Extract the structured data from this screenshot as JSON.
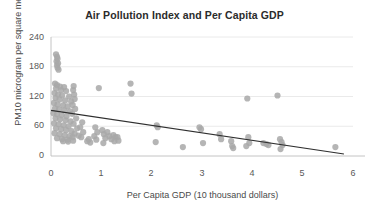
{
  "chart_data": {
    "type": "scatter",
    "title": "Air Pollution Index and Per Capita GDP",
    "xlabel": "Per Capita GDP (10 thousand dollars)",
    "ylabel": "PM10  microgram per square meter",
    "xlim": [
      0,
      6
    ],
    "ylim": [
      0,
      240
    ],
    "xticks": [
      "0",
      "1",
      "2",
      "3",
      "4",
      "5",
      "6"
    ],
    "yticks": [
      "240",
      "180",
      "120",
      "60",
      "0"
    ],
    "grid": "horizontal",
    "legend": "none",
    "marker_color": "#a8a8a8",
    "trendline_color": "#2f2f2f",
    "gridline_color": "#e4e4e4",
    "series": [
      {
        "name": "Cities",
        "points": [
          [
            0.1,
            205
          ],
          [
            0.12,
            200
          ],
          [
            0.13,
            196
          ],
          [
            0.11,
            191
          ],
          [
            0.14,
            187
          ],
          [
            0.12,
            183
          ],
          [
            0.13,
            178
          ],
          [
            0.15,
            174
          ],
          [
            0.08,
            146
          ],
          [
            0.12,
            143
          ],
          [
            0.18,
            140
          ],
          [
            0.26,
            139
          ],
          [
            0.45,
            141
          ],
          [
            0.1,
            136
          ],
          [
            0.2,
            133
          ],
          [
            0.3,
            131
          ],
          [
            0.44,
            133
          ],
          [
            0.07,
            127
          ],
          [
            0.14,
            124
          ],
          [
            0.22,
            122
          ],
          [
            0.36,
            120
          ],
          [
            0.46,
            124
          ],
          [
            0.09,
            117
          ],
          [
            0.17,
            114
          ],
          [
            0.28,
            112
          ],
          [
            0.4,
            110
          ],
          [
            0.47,
            115
          ],
          [
            0.06,
            107
          ],
          [
            0.13,
            104
          ],
          [
            0.24,
            102
          ],
          [
            0.33,
            100
          ],
          [
            0.43,
            103
          ],
          [
            0.08,
            96
          ],
          [
            0.16,
            94
          ],
          [
            0.27,
            92
          ],
          [
            0.38,
            90
          ],
          [
            0.48,
            95
          ],
          [
            0.05,
            86
          ],
          [
            0.12,
            84
          ],
          [
            0.21,
            82
          ],
          [
            0.31,
            80
          ],
          [
            0.42,
            85
          ],
          [
            0.09,
            76
          ],
          [
            0.18,
            74
          ],
          [
            0.29,
            72
          ],
          [
            0.39,
            70
          ],
          [
            0.5,
            76
          ],
          [
            0.06,
            66
          ],
          [
            0.15,
            64
          ],
          [
            0.25,
            62
          ],
          [
            0.35,
            60
          ],
          [
            0.45,
            65
          ],
          [
            0.1,
            56
          ],
          [
            0.2,
            54
          ],
          [
            0.3,
            52
          ],
          [
            0.41,
            50
          ],
          [
            0.52,
            56
          ],
          [
            0.07,
            46
          ],
          [
            0.17,
            44
          ],
          [
            0.27,
            42
          ],
          [
            0.37,
            40
          ],
          [
            0.47,
            45
          ],
          [
            0.12,
            36
          ],
          [
            0.22,
            34
          ],
          [
            0.33,
            33
          ],
          [
            0.43,
            38
          ],
          [
            0.55,
            41
          ],
          [
            0.24,
            30
          ],
          [
            0.34,
            29
          ],
          [
            0.44,
            31
          ],
          [
            0.62,
            68
          ],
          [
            0.58,
            58
          ],
          [
            0.64,
            48
          ],
          [
            0.6,
            38
          ],
          [
            0.72,
            30
          ],
          [
            0.78,
            27
          ],
          [
            0.75,
            34
          ],
          [
            0.88,
            58
          ],
          [
            0.92,
            48
          ],
          [
            0.86,
            40
          ],
          [
            0.9,
            33
          ],
          [
            0.95,
            137
          ],
          [
            1.02,
            52
          ],
          [
            1.05,
            44
          ],
          [
            1.08,
            36
          ],
          [
            1.04,
            26
          ],
          [
            1.12,
            48
          ],
          [
            1.16,
            40
          ],
          [
            1.2,
            34
          ],
          [
            1.24,
            42
          ],
          [
            1.28,
            38
          ],
          [
            1.32,
            38
          ],
          [
            1.26,
            30
          ],
          [
            1.34,
            31
          ],
          [
            1.58,
            146
          ],
          [
            1.6,
            126
          ],
          [
            2.1,
            62
          ],
          [
            2.12,
            58
          ],
          [
            2.08,
            28
          ],
          [
            2.62,
            18
          ],
          [
            2.95,
            58
          ],
          [
            2.98,
            54
          ],
          [
            3.02,
            26
          ],
          [
            3.35,
            44
          ],
          [
            3.38,
            34
          ],
          [
            3.58,
            30
          ],
          [
            3.6,
            20
          ],
          [
            3.62,
            16
          ],
          [
            3.9,
            116
          ],
          [
            3.92,
            38
          ],
          [
            3.94,
            26
          ],
          [
            3.88,
            20
          ],
          [
            4.22,
            26
          ],
          [
            4.28,
            24
          ],
          [
            4.32,
            22
          ],
          [
            4.5,
            122
          ],
          [
            4.55,
            34
          ],
          [
            4.58,
            28
          ],
          [
            4.6,
            22
          ],
          [
            4.56,
            14
          ],
          [
            5.65,
            18
          ]
        ]
      }
    ],
    "trendline": {
      "name": "Linear trend",
      "x0": 0.0,
      "y0": 92,
      "x1": 5.82,
      "y1": 4
    }
  }
}
